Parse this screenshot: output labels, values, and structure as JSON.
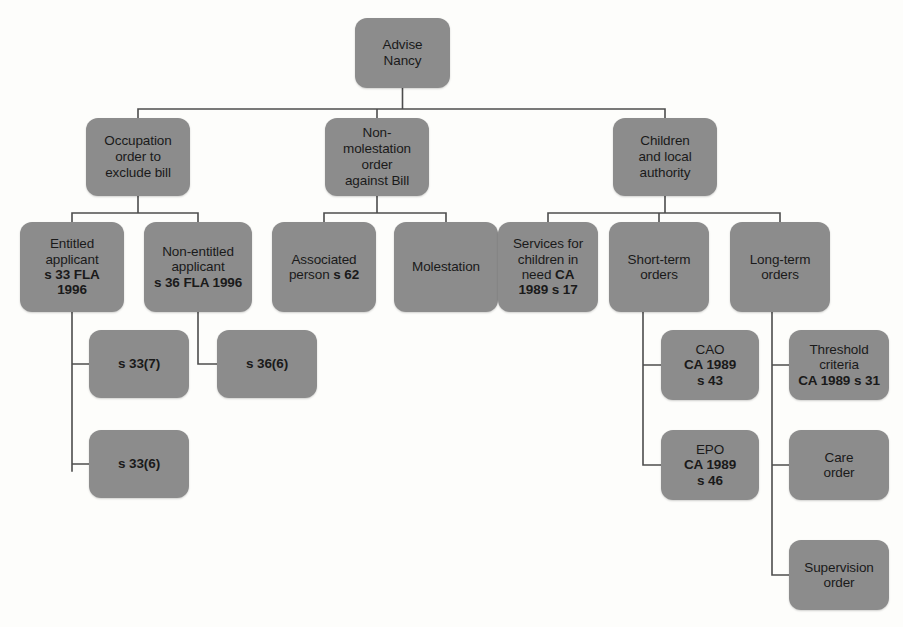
{
  "diagram": {
    "type": "tree-flowchart",
    "colors": {
      "node_fill": "#8c8c8c",
      "connector": "#4d4d4d",
      "text": "#1a1a1a",
      "background": "#fdfdfb"
    },
    "nodes": [
      {
        "id": "advise-nancy",
        "name": "node-advise-nancy",
        "level": 0,
        "text": "Advise Nancy",
        "html": "Advise<br>Nancy",
        "x": 355,
        "y": 18,
        "w": 95,
        "h": 70
      },
      {
        "id": "occupation-order",
        "name": "node-occupation-order",
        "level": 1,
        "text": "Occupation order to exclude bill",
        "html": "Occupation<br>order to<br>exclude bill",
        "x": 86,
        "y": 118,
        "w": 104,
        "h": 78
      },
      {
        "id": "non-molestation-order",
        "name": "node-non-molestation-order",
        "level": 1,
        "text": "Non-molestation order against Bill",
        "html": "Non-<br>molestation<br>order<br>against Bill",
        "x": 325,
        "y": 118,
        "w": 104,
        "h": 78
      },
      {
        "id": "children-local-authority",
        "name": "node-children-and-local-authority",
        "level": 1,
        "text": "Children and local authority",
        "html": "Children<br>and local<br>authority",
        "x": 613,
        "y": 118,
        "w": 104,
        "h": 78
      },
      {
        "id": "entitled-applicant",
        "name": "node-entitled-applicant",
        "level": 2,
        "text": "Entitled applicant s 33 FLA 1996",
        "html": "Entitled<br>applicant<br><b>s 33 FLA<br>1996</b>",
        "x": 20,
        "y": 222,
        "w": 104,
        "h": 90
      },
      {
        "id": "non-entitled-applicant",
        "name": "node-non-entitled-applicant",
        "level": 2,
        "text": "Non-entitled applicant s 36 FLA 1996",
        "html": "Non-entitled<br>applicant<br><b>s 36 FLA 1996</b>",
        "x": 144,
        "y": 222,
        "w": 108,
        "h": 90
      },
      {
        "id": "associated-person",
        "name": "node-associated-person",
        "level": 2,
        "text": "Associated person s 62",
        "html": "Associated<br>person <b>s 62</b>",
        "x": 272,
        "y": 222,
        "w": 104,
        "h": 90
      },
      {
        "id": "molestation",
        "name": "node-molestation",
        "level": 2,
        "text": "Molestation",
        "html": "Molestation",
        "x": 394,
        "y": 222,
        "w": 104,
        "h": 90
      },
      {
        "id": "services-for-children",
        "name": "node-services-for-children-in-need",
        "level": 2,
        "text": "Services for children in need CA 1989 s 17",
        "html": "Services for<br>children in<br>need <b>CA<br>1989 s 17</b>",
        "x": 498,
        "y": 222,
        "w": 100,
        "h": 90
      },
      {
        "id": "short-term-orders",
        "name": "node-short-term-orders",
        "level": 2,
        "text": "Short-term orders",
        "html": "Short-term<br>orders",
        "x": 609,
        "y": 222,
        "w": 100,
        "h": 90
      },
      {
        "id": "long-term-orders",
        "name": "node-long-term-orders",
        "level": 2,
        "text": "Long-term orders",
        "html": "Long-term<br>orders",
        "x": 730,
        "y": 222,
        "w": 100,
        "h": 90
      },
      {
        "id": "s-33-7",
        "name": "node-s-33-7",
        "level": 3,
        "text": "s 33(7)",
        "html": "<b>s 33(7)</b>",
        "x": 89,
        "y": 330,
        "w": 100,
        "h": 68
      },
      {
        "id": "s-36-6",
        "name": "node-s-36-6",
        "level": 3,
        "text": "s 36(6)",
        "html": "<b>s 36(6)</b>",
        "x": 217,
        "y": 330,
        "w": 100,
        "h": 68
      },
      {
        "id": "s-33-6",
        "name": "node-s-33-6",
        "level": 3,
        "text": "s 33(6)",
        "html": "<b>s 33(6)</b>",
        "x": 89,
        "y": 430,
        "w": 100,
        "h": 68
      },
      {
        "id": "cao",
        "name": "node-cao",
        "level": 3,
        "text": "CAO CA 1989 s 43",
        "html": "CAO<br><b>CA 1989<br>s 43</b>",
        "x": 661,
        "y": 330,
        "w": 98,
        "h": 70
      },
      {
        "id": "threshold-criteria",
        "name": "node-threshold-criteria",
        "level": 3,
        "text": "Threshold criteria CA 1989 s 31",
        "html": "Threshold<br>criteria<br><b>CA 1989 s 31</b>",
        "x": 789,
        "y": 330,
        "w": 100,
        "h": 70
      },
      {
        "id": "epo",
        "name": "node-epo",
        "level": 3,
        "text": "EPO CA 1989 s 46",
        "html": "EPO<br><b>CA 1989<br>s 46</b>",
        "x": 661,
        "y": 430,
        "w": 98,
        "h": 70
      },
      {
        "id": "care-order",
        "name": "node-care-order",
        "level": 3,
        "text": "Care order",
        "html": "Care<br>order",
        "x": 789,
        "y": 430,
        "w": 100,
        "h": 70
      },
      {
        "id": "supervision-order",
        "name": "node-supervision-order",
        "level": 3,
        "text": "Supervision order",
        "html": "Supervision<br>order",
        "x": 789,
        "y": 540,
        "w": 100,
        "h": 70
      }
    ],
    "connectors": [
      {
        "name": "connector-root-to-level1",
        "from": "advise-nancy",
        "to": [
          "occupation-order",
          "non-molestation-order",
          "children-local-authority"
        ],
        "path": "M402.5,88 L402.5,109 M138,109 L665,109 M138,109 L138,118 M377,109 L377,118 M665,109 L665,118"
      },
      {
        "name": "connector-occupation-to-applicants",
        "from": "occupation-order",
        "to": [
          "entitled-applicant",
          "non-entitled-applicant"
        ],
        "path": "M138,196 L138,213 M72,213 L198,213 M72,213 L72,222 M198,213 L198,222"
      },
      {
        "name": "connector-nonmolestation-to-children",
        "from": "non-molestation-order",
        "to": [
          "associated-person",
          "molestation"
        ],
        "path": "M377,196 L377,213 M324,213 L446,213 M324,213 L324,222 M446,213 L446,222"
      },
      {
        "name": "connector-children-to-services",
        "from": "children-local-authority",
        "to": [
          "services-for-children",
          "short-term-orders",
          "long-term-orders"
        ],
        "path": "M665,196 L665,213 M548,213 L780,213 M548,213 L548,222 M659,213 L659,222 M780,213 L780,222"
      },
      {
        "name": "connector-entitled-to-subsections",
        "from": "entitled-applicant",
        "to": [
          "s-33-7",
          "s-33-6"
        ],
        "path": "M72,312 L72,471 M72,364 L89,364 M72,464 L89,464"
      },
      {
        "name": "connector-nonentitled-to-s36",
        "from": "non-entitled-applicant",
        "to": [
          "s-36-6"
        ],
        "path": "M198,312 L198,364 L217,364"
      },
      {
        "name": "connector-shortterm-to-orders",
        "from": "short-term-orders",
        "to": [
          "cao",
          "epo"
        ],
        "path": "M643,312 L643,465 M643,365 L661,365 M643,465 L661,465"
      },
      {
        "name": "connector-longterm-to-orders",
        "from": "long-term-orders",
        "to": [
          "threshold-criteria",
          "care-order",
          "supervision-order"
        ],
        "path": "M772,312 L772,575 M772,365 L789,365 M772,465 L789,465 M772,575 L789,575"
      }
    ]
  }
}
